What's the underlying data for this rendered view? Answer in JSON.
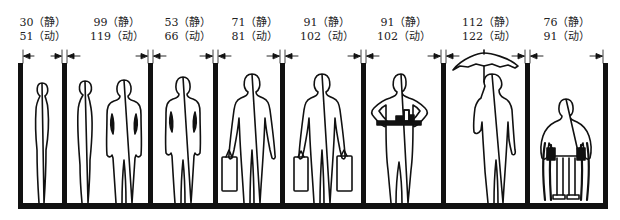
{
  "diagram": {
    "title": "",
    "units_note": "",
    "static_marker": "静",
    "dynamic_marker": "动",
    "colors": {
      "ink": "#111111",
      "background": "#ffffff"
    },
    "compartments": [
      {
        "id": "c1",
        "subject": "standing-side-view-person",
        "static": "30（静）",
        "dynamic": "51（动）",
        "static_value": 30,
        "dynamic_value": 51
      },
      {
        "id": "c2",
        "subject": "two-persons-side-and-front",
        "static": "99（静）",
        "dynamic": "119（动）",
        "static_value": 99,
        "dynamic_value": 119
      },
      {
        "id": "c3",
        "subject": "standing-front-view-person",
        "static": "53（静）",
        "dynamic": "66（动）",
        "static_value": 53,
        "dynamic_value": 66
      },
      {
        "id": "c4",
        "subject": "person-carrying-one-bag",
        "static": "71（静）",
        "dynamic": "81（动）",
        "static_value": 71,
        "dynamic_value": 81
      },
      {
        "id": "c5",
        "subject": "person-carrying-two-bags",
        "static": "91（静）",
        "dynamic": "102（动）",
        "static_value": 91,
        "dynamic_value": 102
      },
      {
        "id": "c6",
        "subject": "person-carrying-tray",
        "static": "91（静）",
        "dynamic": "102（动）",
        "static_value": 91,
        "dynamic_value": 102
      },
      {
        "id": "c7",
        "subject": "person-with-umbrella",
        "static": "112（静）",
        "dynamic": "122（动）",
        "static_value": 112,
        "dynamic_value": 122
      },
      {
        "id": "c8",
        "subject": "person-in-wheelchair",
        "static": "76（静）",
        "dynamic": "91（动）",
        "static_value": 76,
        "dynamic_value": 91
      }
    ]
  }
}
